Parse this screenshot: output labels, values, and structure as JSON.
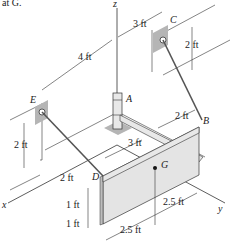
{
  "header_text": "at G.",
  "axes": {
    "x": "x",
    "y": "y",
    "z": "z"
  },
  "points": {
    "A": "A",
    "B": "B",
    "C": "C",
    "D": "D",
    "E": "E",
    "G": "G"
  },
  "dimensions": {
    "top_4ft": "4 ft",
    "top_3ft": "3 ft",
    "c_2ft": "2 ft",
    "e_2ft": "2 ft",
    "b_2ft": "2 ft",
    "mid_3ft": "3 ft",
    "d_2ft": "2 ft",
    "plate_1ft_top": "1 ft",
    "plate_1ft_bottom": "1 ft",
    "plate_2_5ft_right": "2.5 ft",
    "plate_2_5ft_bottom": "2.5 ft"
  },
  "colors": {
    "line": "#333333",
    "plate_fill": "#e4e4e4",
    "plate_edge": "#bdbdbd",
    "bracket_fill": "#b5b5b5",
    "rod_fill": "#e8e8e8"
  }
}
